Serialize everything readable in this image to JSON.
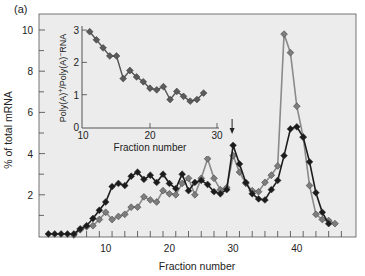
{
  "panel_label": "(a)",
  "colors": {
    "background": "#ffffff",
    "plot_bg": "#ececec",
    "axis": "#333333",
    "black_series": "#1c1c1c",
    "gray_series_line": "#8a8a8a",
    "gray_series_marker": "#7d7d7d",
    "text": "#222222"
  },
  "chart_data": [
    {
      "type": "line",
      "title": "",
      "xlabel": "Fraction number",
      "ylabel": "% of total mRNA",
      "xlim": [
        0,
        48
      ],
      "ylim": [
        0,
        10.5
      ],
      "xticks": [
        10,
        20,
        30,
        40
      ],
      "yticks": [
        2,
        4,
        6,
        8,
        10
      ],
      "grid": false,
      "legend": null,
      "annotations": [
        {
          "type": "arrow",
          "x": 30,
          "direction": "down",
          "label": ""
        }
      ],
      "series": [
        {
          "name": "black",
          "x": [
            1,
            2,
            3,
            4,
            5,
            6,
            7,
            8,
            9,
            10,
            11,
            12,
            13,
            14,
            15,
            16,
            17,
            18,
            19,
            20,
            21,
            22,
            23,
            24,
            25,
            26,
            27,
            28,
            29,
            30,
            31,
            32,
            33,
            34,
            35,
            36,
            37,
            38,
            39,
            40,
            41,
            42,
            43,
            44,
            45
          ],
          "values": [
            0.1,
            0.1,
            0.1,
            0.1,
            0.1,
            0.35,
            0.5,
            0.85,
            1.25,
            1.65,
            2.4,
            2.55,
            2.45,
            2.9,
            3.1,
            2.75,
            2.95,
            2.6,
            3.0,
            2.55,
            2.3,
            3.0,
            2.2,
            2.6,
            2.7,
            2.5,
            2.15,
            2.05,
            2.25,
            4.4,
            3.5,
            2.6,
            2.05,
            1.8,
            1.75,
            2.25,
            2.7,
            3.9,
            5.2,
            5.3,
            4.8,
            3.6,
            2.1,
            1.15,
            0.6
          ]
        },
        {
          "name": "gray",
          "x": [
            5,
            6,
            7,
            8,
            9,
            10,
            11,
            12,
            13,
            14,
            15,
            16,
            17,
            18,
            19,
            20,
            21,
            22,
            23,
            24,
            25,
            26,
            27,
            28,
            29,
            30,
            31,
            32,
            33,
            34,
            35,
            36,
            37,
            38,
            39,
            40,
            41,
            42,
            43,
            44,
            45,
            46
          ],
          "values": [
            0.05,
            0.3,
            0.45,
            0.5,
            0.8,
            1.15,
            0.8,
            0.95,
            1.05,
            1.4,
            1.4,
            1.9,
            1.75,
            1.65,
            2.2,
            2.05,
            2.0,
            2.55,
            2.8,
            2.0,
            2.8,
            3.75,
            2.8,
            2.25,
            2.35,
            3.9,
            3.1,
            2.55,
            2.2,
            2.15,
            2.6,
            2.95,
            3.4,
            9.8,
            8.9,
            6.3,
            4.8,
            2.45,
            1.05,
            0.8,
            0.75,
            0.6
          ]
        }
      ]
    },
    {
      "type": "line",
      "title": "",
      "xlabel": "Fraction number",
      "ylabel": "Poly(A)+/Poly(A)−RNA",
      "xlim": [
        10,
        30
      ],
      "ylim": [
        0,
        3
      ],
      "xticks": [
        10,
        20,
        30
      ],
      "yticks": [
        0,
        1,
        2,
        3
      ],
      "grid": false,
      "legend": null,
      "series": [
        {
          "name": "ratio",
          "x": [
            11,
            12,
            13,
            14,
            15,
            16,
            17,
            18,
            19,
            20,
            21,
            22,
            23,
            24,
            25,
            26,
            27,
            28
          ],
          "values": [
            2.95,
            2.7,
            2.45,
            2.2,
            2.2,
            1.5,
            1.75,
            1.55,
            1.4,
            1.2,
            1.15,
            1.25,
            0.85,
            1.1,
            0.95,
            0.8,
            0.85,
            1.05
          ]
        }
      ]
    }
  ],
  "main_chart": {
    "xlabel": "Fraction number",
    "ylabel": "% of total mRNA",
    "xtick_labels": [
      "10",
      "20",
      "30",
      "40"
    ],
    "ytick_labels": [
      "2",
      "4",
      "6",
      "8",
      "10"
    ]
  },
  "inset_chart": {
    "xlabel": "Fraction number",
    "ylabel": "Poly(A)+/Poly(A)−RNA",
    "xtick_labels": [
      "10",
      "20",
      "30"
    ],
    "ytick_labels": [
      "0",
      "1",
      "2",
      "3"
    ]
  }
}
